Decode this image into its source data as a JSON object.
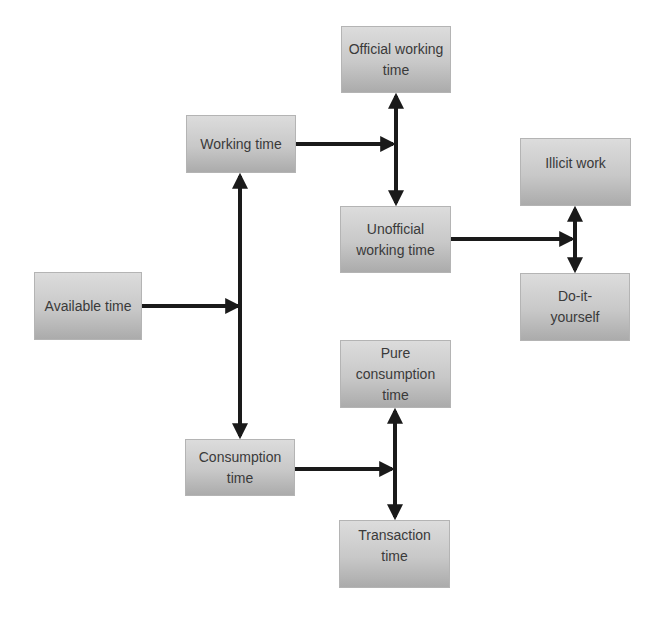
{
  "diagram": {
    "type": "flowchart",
    "nodes": {
      "available": {
        "label": "Available time"
      },
      "working": {
        "label": "Working time"
      },
      "consumption": {
        "label": "Consumption time"
      },
      "official": {
        "label": "Official working time"
      },
      "unofficial": {
        "label": "Unofficial working time"
      },
      "illicit": {
        "label": "Illicit work"
      },
      "diy": {
        "label": "Do-it-yourself"
      },
      "pure": {
        "label": "Pure consumption time"
      },
      "transaction": {
        "label": "Transaction time"
      }
    },
    "edges": [
      {
        "from": "available",
        "to": [
          "working",
          "consumption"
        ],
        "style": "split"
      },
      {
        "from": "working",
        "to": [
          "official",
          "unofficial"
        ],
        "style": "split"
      },
      {
        "from": "unofficial",
        "to": [
          "illicit",
          "diy"
        ],
        "style": "split"
      },
      {
        "from": "consumption",
        "to": [
          "pure",
          "transaction"
        ],
        "style": "split"
      }
    ],
    "colors": {
      "box_top": "#dcdcdc",
      "box_bottom": "#ababab",
      "arrow": "#1a1a1a",
      "text": "#3a3a3a"
    }
  }
}
